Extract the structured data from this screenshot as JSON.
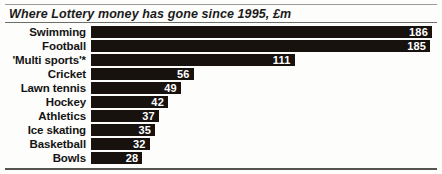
{
  "chart_data": {
    "type": "bar",
    "orientation": "horizontal",
    "title": "Where Lottery money has gone since 1995, £m",
    "xlabel": "",
    "ylabel": "",
    "xlim": [
      0,
      186
    ],
    "grid": false,
    "legend": null,
    "value_label_position": "inside-end",
    "categories": [
      "Swimming",
      "Football",
      "'Multi sports'*",
      "Cricket",
      "Lawn tennis",
      "Hockey",
      "Athletics",
      "Ice skating",
      "Basketball",
      "Bowls"
    ],
    "values": [
      186,
      185,
      111,
      56,
      49,
      42,
      37,
      35,
      32,
      28
    ],
    "bars": [
      {
        "category": "Swimming",
        "value": 186,
        "label": "186"
      },
      {
        "category": "Football",
        "value": 185,
        "label": "185"
      },
      {
        "category": "'Multi sports'*",
        "value": 111,
        "label": "111"
      },
      {
        "category": "Cricket",
        "value": 56,
        "label": "56"
      },
      {
        "category": "Lawn tennis",
        "value": 49,
        "label": "49"
      },
      {
        "category": "Hockey",
        "value": 42,
        "label": "42"
      },
      {
        "category": "Athletics",
        "value": 37,
        "label": "37"
      },
      {
        "category": "Ice skating",
        "value": 35,
        "label": "35"
      },
      {
        "category": "Basketball",
        "value": 32,
        "label": "32"
      },
      {
        "category": "Bowls",
        "value": 28,
        "label": "28"
      }
    ],
    "colors": {
      "bar": "#18120f",
      "value_text": "#ffffff",
      "category_text": "#141414",
      "background": "#fdfdfb",
      "rule": "#6d6d69"
    }
  }
}
